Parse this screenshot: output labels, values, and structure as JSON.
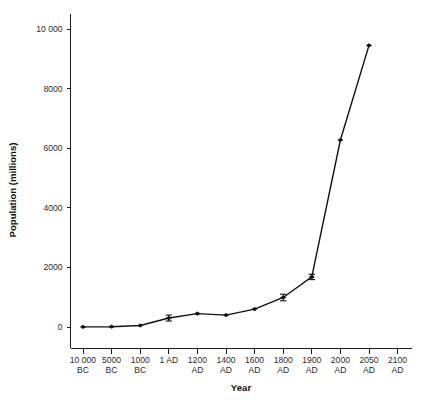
{
  "chart_data": {
    "type": "line",
    "title": "",
    "subtitle": "",
    "xlabel": "Year",
    "ylabel": "Population (millions)",
    "grid": false,
    "legend": "none",
    "marker": "filled-diamond",
    "errorbars": true,
    "categories": [
      "10 000\nBC",
      "5000\nBC",
      "1000\nBC",
      "1 AD",
      "1200\nAD",
      "1400\nAD",
      "1600\nAD",
      "1800\nAD",
      "1900\nAD",
      "2000\nAD",
      "2050\nAD",
      "2100\nAD"
    ],
    "x_tick_labels": [
      {
        "line1": "10 000",
        "line2": "BC"
      },
      {
        "line1": "5000",
        "line2": "BC"
      },
      {
        "line1": "1000",
        "line2": "BC"
      },
      {
        "line1": "1 AD",
        "line2": ""
      },
      {
        "line1": "1200",
        "line2": "AD"
      },
      {
        "line1": "1400",
        "line2": "AD"
      },
      {
        "line1": "1600",
        "line2": "AD"
      },
      {
        "line1": "1800",
        "line2": "AD"
      },
      {
        "line1": "1900",
        "line2": "AD"
      },
      {
        "line1": "2000",
        "line2": "AD"
      },
      {
        "line1": "2050",
        "line2": "AD"
      },
      {
        "line1": "2100",
        "line2": "AD"
      }
    ],
    "y_tick_labels": [
      "0",
      "2000",
      "4000",
      "6000",
      "8000",
      "10 000"
    ],
    "y_ticks": [
      0,
      2000,
      4000,
      6000,
      8000,
      10000
    ],
    "ylim": [
      0,
      10600
    ],
    "values": [
      4,
      10,
      50,
      300,
      450,
      400,
      600,
      990,
      1680,
      6275,
      9450,
      null
    ],
    "errors_low": [
      0,
      0,
      0,
      100,
      0,
      0,
      0,
      110,
      90,
      0,
      0,
      null
    ],
    "errors_high": [
      0,
      0,
      0,
      100,
      0,
      0,
      0,
      110,
      90,
      0,
      0,
      null
    ],
    "points": [
      {
        "x": "10 000 BC",
        "y": 4,
        "err_low": 0,
        "err_high": 0
      },
      {
        "x": "5000 BC",
        "y": 10,
        "err_low": 0,
        "err_high": 0
      },
      {
        "x": "1000 BC",
        "y": 50,
        "err_low": 0,
        "err_high": 0
      },
      {
        "x": "1 AD",
        "y": 300,
        "err_low": 100,
        "err_high": 100
      },
      {
        "x": "1200 AD",
        "y": 450,
        "err_low": 0,
        "err_high": 0
      },
      {
        "x": "1400 AD",
        "y": 400,
        "err_low": 0,
        "err_high": 0
      },
      {
        "x": "1600 AD",
        "y": 600,
        "err_low": 0,
        "err_high": 0
      },
      {
        "x": "1800 AD",
        "y": 990,
        "err_low": 110,
        "err_high": 110
      },
      {
        "x": "1900 AD",
        "y": 1680,
        "err_low": 90,
        "err_high": 90
      },
      {
        "x": "2000 AD",
        "y": 6275,
        "err_low": 0,
        "err_high": 0
      },
      {
        "x": "2050 AD",
        "y": 9450,
        "err_low": 0,
        "err_high": 0
      }
    ],
    "colors": {
      "line": "#111111",
      "marker": "#111111",
      "axis": "#1a1a1a",
      "background": "#ffffff",
      "tick_label": "#2b2b2b"
    }
  },
  "axes": {
    "x_title": "Year",
    "y_title": "Population (millions)"
  },
  "caption": {
    "text": ""
  }
}
